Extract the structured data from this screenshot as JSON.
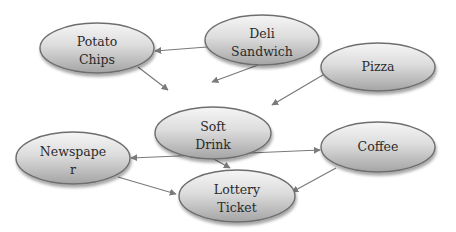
{
  "diagram": {
    "type": "directed-graph",
    "colors": {
      "node_fill_light": "#f4f4f4",
      "node_fill_dark": "#a8a8a8",
      "node_stroke": "#6e6e6e",
      "edge": "#7a7a7a",
      "text": "#2a2a2a",
      "background": "#ffffff"
    },
    "nodes": [
      {
        "id": "potato_chips",
        "line1": "Potato",
        "line2": "Chips",
        "cx": 97,
        "cy": 48,
        "rx": 57,
        "ry": 25
      },
      {
        "id": "deli_sandwich",
        "line1": "Deli",
        "line2": "Sandwich",
        "cx": 262,
        "cy": 40,
        "rx": 57,
        "ry": 25
      },
      {
        "id": "pizza",
        "line1": "Pizza",
        "line2": "",
        "cx": 378,
        "cy": 67,
        "rx": 57,
        "ry": 24
      },
      {
        "id": "soft_drink",
        "line1": "Soft",
        "line2": "Drink",
        "cx": 213,
        "cy": 133,
        "rx": 58,
        "ry": 26
      },
      {
        "id": "newspaper",
        "line1": "Newspape",
        "line2": "r",
        "cx": 73,
        "cy": 158,
        "rx": 57,
        "ry": 26
      },
      {
        "id": "coffee",
        "line1": "Coffee",
        "line2": "",
        "cx": 378,
        "cy": 147,
        "rx": 57,
        "ry": 25
      },
      {
        "id": "lottery_ticket",
        "line1": "Lottery",
        "line2": "Ticket",
        "cx": 237,
        "cy": 196,
        "rx": 58,
        "ry": 26
      }
    ],
    "edges": [
      {
        "from": "deli_sandwich",
        "to": "potato_chips",
        "x1": 207,
        "y1": 47,
        "x2": 155,
        "y2": 51,
        "bidirectional": false
      },
      {
        "from": "potato_chips",
        "to": "soft_drink",
        "x1": 138,
        "y1": 67,
        "x2": 168,
        "y2": 90,
        "bidirectional": false
      },
      {
        "from": "deli_sandwich",
        "to": "soft_drink",
        "x1": 258,
        "y1": 65,
        "x2": 212,
        "y2": 82,
        "bidirectional": false
      },
      {
        "from": "pizza",
        "to": "soft_drink",
        "x1": 328,
        "y1": 72,
        "x2": 272,
        "y2": 105,
        "bidirectional": false
      },
      {
        "from": "soft_drink",
        "to": "lottery_ticket",
        "x1": 212,
        "y1": 158,
        "x2": 230,
        "y2": 168,
        "bidirectional": false
      },
      {
        "from": "newspaper",
        "to": "coffee",
        "x1": 131,
        "y1": 158,
        "x2": 320,
        "y2": 150,
        "bidirectional": true
      },
      {
        "from": "newspaper",
        "to": "lottery_ticket",
        "x1": 118,
        "y1": 177,
        "x2": 176,
        "y2": 194,
        "bidirectional": false
      },
      {
        "from": "coffee",
        "to": "lottery_ticket",
        "x1": 336,
        "y1": 168,
        "x2": 292,
        "y2": 192,
        "bidirectional": false
      }
    ]
  }
}
